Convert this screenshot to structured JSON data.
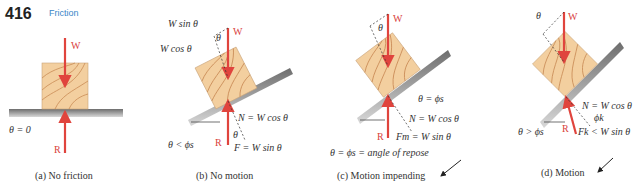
{
  "header": {
    "page_number": "416",
    "section": "Friction"
  },
  "colors": {
    "force_arrow": "#e0443d",
    "wood_fill": "#f3cf9f",
    "wood_grain": "#c98b56",
    "surface": "#8c8c8c",
    "section_title": "#3a86c8"
  },
  "panels": [
    {
      "id": "a",
      "caption_letter": "(a)",
      "caption_text": "No friction",
      "labels": {
        "weight": "W",
        "reaction": "R",
        "angle": "θ = 0"
      }
    },
    {
      "id": "b",
      "caption_letter": "(b)",
      "caption_text": "No motion",
      "labels": {
        "weight": "W",
        "reaction": "R",
        "w_sin": "W sin θ",
        "w_cos": "W cos θ",
        "theta": "θ",
        "normal": "N = W cos θ",
        "friction": "F = W sin θ",
        "angle_cond": "θ < ϕs"
      }
    },
    {
      "id": "c",
      "caption_letter": "(c)",
      "caption_text": "Motion impending",
      "labels": {
        "weight": "W",
        "reaction": "R",
        "theta": "θ",
        "theta_eq": "θ = ϕs",
        "normal": "N = W cos θ",
        "friction": "Fm = W sin θ",
        "repose": "θ = ϕs = angle of repose"
      }
    },
    {
      "id": "d",
      "caption_letter": "(d)",
      "caption_text": "Motion",
      "labels": {
        "weight": "W",
        "reaction": "R",
        "theta": "θ",
        "phi_k": "ϕk",
        "normal": "N = W cos θ",
        "friction": "Fk < W sin θ",
        "angle_cond": "θ > ϕs"
      }
    }
  ]
}
